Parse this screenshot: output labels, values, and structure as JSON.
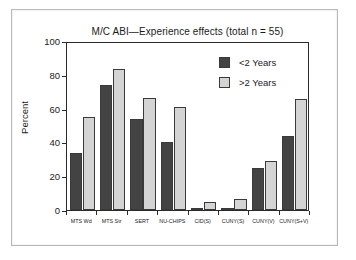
{
  "chart_data": {
    "type": "bar",
    "title": "M/C ABI—Experience effects (total n = 55)",
    "xlabel": "",
    "ylabel": "Percent",
    "ylim": [
      0,
      100
    ],
    "yticks": [
      0,
      20,
      40,
      60,
      80,
      100
    ],
    "grid": false,
    "legend_position": "top-right",
    "categories": [
      "MTS Wd",
      "MTS Str",
      "SERT",
      "NU-CHIPS",
      "CID(S)",
      "CUNY(S)",
      "CUNY(V)",
      "CUNY(S+V)"
    ],
    "series": [
      {
        "name": "<2 Years",
        "color": "#434343",
        "values": [
          34,
          74,
          54,
          40.5,
          1,
          1,
          25,
          44
        ]
      },
      {
        "name": ">2 Years",
        "color": "#d4d4d4",
        "values": [
          55,
          83.5,
          66,
          61,
          5,
          6.5,
          29,
          65.5
        ]
      }
    ]
  }
}
